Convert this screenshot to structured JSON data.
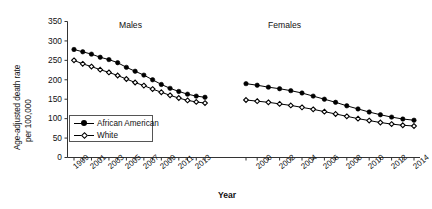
{
  "chart_data": {
    "type": "line",
    "title": "",
    "xlabel": "Year",
    "ylabel_line1": "Age-adjusted death rate",
    "ylabel_line2": "per 100,000",
    "ylim": [
      0,
      350
    ],
    "yticks": [
      0,
      50,
      100,
      150,
      200,
      250,
      300,
      350
    ],
    "grid": false,
    "legend_position": "inside-lower-left",
    "legend_entries": [
      "African American",
      "White"
    ],
    "panels": [
      {
        "name": "Males",
        "x": [
          1999,
          2000,
          2001,
          2002,
          2003,
          2004,
          2005,
          2006,
          2007,
          2008,
          2009,
          2010,
          2011,
          2012,
          2013,
          2014
        ],
        "xticklabels": [
          "1999",
          "",
          "2001",
          "",
          "2003",
          "",
          "2005",
          "",
          "2007",
          "",
          "2009",
          "",
          "2011",
          "",
          "2013",
          ""
        ],
        "series": [
          {
            "name": "African American",
            "marker": "filled-circle",
            "values": [
              278,
              272,
              266,
              258,
              252,
              244,
              232,
              222,
              212,
              200,
              188,
              178,
              170,
              163,
              158,
              155
            ]
          },
          {
            "name": "White",
            "marker": "open-diamond",
            "values": [
              250,
              241,
              234,
              226,
              219,
              211,
              202,
              193,
              185,
              176,
              168,
              160,
              153,
              147,
              143,
              140
            ]
          }
        ]
      },
      {
        "name": "Females",
        "x": [
          1999,
          2000,
          2001,
          2002,
          2003,
          2004,
          2005,
          2006,
          2007,
          2008,
          2009,
          2010,
          2011,
          2012,
          2013,
          2014
        ],
        "xticklabels": [
          "",
          "2000",
          "",
          "2002",
          "",
          "2004",
          "",
          "2006",
          "",
          "2008",
          "",
          "2010",
          "",
          "2012",
          "",
          "2014"
        ],
        "series": [
          {
            "name": "African American",
            "marker": "filled-circle",
            "values": [
              190,
              186,
              181,
              177,
              172,
              166,
              158,
              150,
              142,
              133,
              125,
              117,
              110,
              104,
              99,
              96
            ]
          },
          {
            "name": "White",
            "marker": "open-diamond",
            "values": [
              148,
              145,
              142,
              138,
              134,
              129,
              124,
              118,
              112,
              106,
              100,
              95,
              90,
              86,
              83,
              81
            ]
          }
        ]
      }
    ]
  },
  "colors": {
    "series_line": "#000000",
    "axis": "#333333",
    "text": "#111111",
    "background": "#ffffff"
  }
}
